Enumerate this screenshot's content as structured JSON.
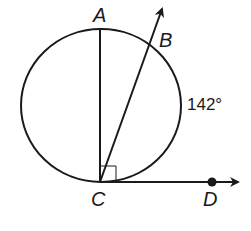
{
  "diagram": {
    "type": "circle-tangent-chord",
    "points": {
      "A": {
        "label": "A"
      },
      "B": {
        "label": "B"
      },
      "C": {
        "label": "C"
      },
      "D": {
        "label": "D"
      }
    },
    "arc_label": "142°",
    "right_angle_marker": "at C between CA and CD",
    "elements": [
      "circle",
      "diameter AC",
      "ray CB",
      "ray CD (tangent)"
    ]
  },
  "colors": {
    "stroke": "#1a1a1a",
    "background": "#ffffff"
  }
}
